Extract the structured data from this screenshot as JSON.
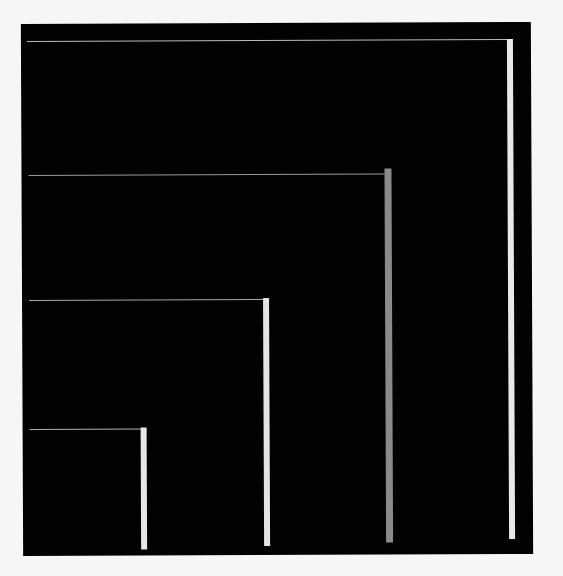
{
  "artwork": {
    "background_color": "#f6f6f6",
    "canvas_color": "#020202",
    "elements": [
      {
        "name": "frame-1",
        "line_color": "#bdbdbd",
        "bar_color": "#e8e8e8"
      },
      {
        "name": "frame-2",
        "line_color": "#9a9a9a",
        "bar_color": "#8a8a8a"
      },
      {
        "name": "frame-3",
        "line_color": "#a8a8a8",
        "bar_color": "#e4e4e4"
      },
      {
        "name": "frame-4",
        "line_color": "#b0b0b0",
        "bar_color": "#e6e6e6"
      }
    ]
  }
}
